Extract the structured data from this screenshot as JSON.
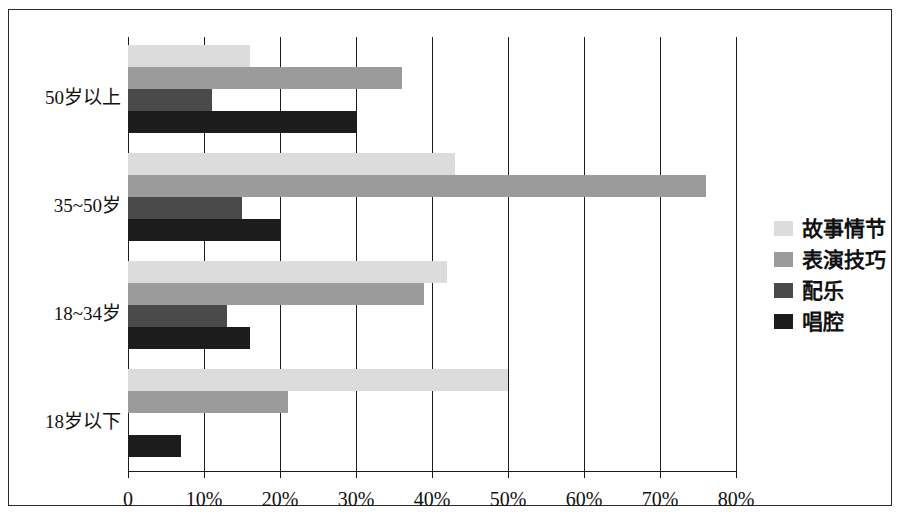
{
  "chart_data": {
    "type": "bar",
    "orientation": "horizontal",
    "title": "",
    "xlabel": "",
    "ylabel": "",
    "xlim": [
      0,
      80
    ],
    "xtick_labels": [
      "0",
      "10%",
      "20%",
      "30%",
      "40%",
      "50%",
      "60%",
      "70%",
      "80%"
    ],
    "xtick_values": [
      0,
      10,
      20,
      30,
      40,
      50,
      60,
      70,
      80
    ],
    "grid": true,
    "legend_position": "right",
    "categories": [
      "50岁以上",
      "35~50岁",
      "18~34岁",
      "18岁以下"
    ],
    "series": [
      {
        "name": "故事情节",
        "color": "#dcdcdc",
        "values": [
          16,
          43,
          42,
          50
        ]
      },
      {
        "name": "表演技巧",
        "color": "#9b9b9b",
        "values": [
          36,
          76,
          39,
          21
        ]
      },
      {
        "name": "配乐",
        "color": "#4a4a4a",
        "values": [
          11,
          15,
          13,
          0
        ]
      },
      {
        "name": "唱腔",
        "color": "#1c1c1c",
        "values": [
          30,
          20,
          16,
          7
        ]
      }
    ]
  },
  "legend": {
    "items": [
      {
        "label": "故事情节",
        "swatch": "story-swatch"
      },
      {
        "label": "表演技巧",
        "swatch": "acting-swatch"
      },
      {
        "label": "配乐",
        "swatch": "music-swatch"
      },
      {
        "label": "唱腔",
        "swatch": "singing-swatch"
      }
    ]
  }
}
